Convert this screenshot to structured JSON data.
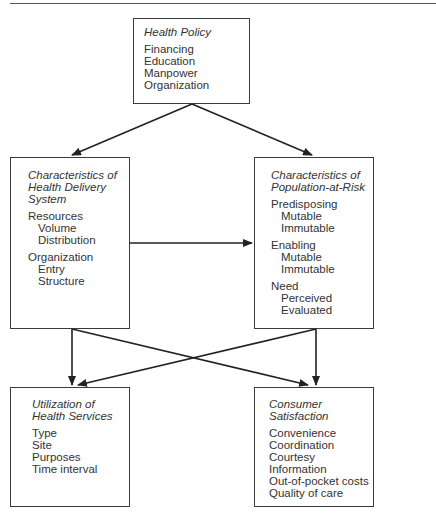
{
  "diagram": {
    "nodes": {
      "health_policy": {
        "title": "Health Policy",
        "items": [
          "Financing",
          "Education",
          "Manpower",
          "Organization"
        ]
      },
      "delivery_system": {
        "title_lines": [
          "Characteristics of",
          "Health Delivery",
          "System"
        ],
        "groups": [
          {
            "label": "Resources",
            "items": [
              "Volume",
              "Distribution"
            ]
          },
          {
            "label": "Organization",
            "items": [
              "Entry",
              "Structure"
            ]
          }
        ]
      },
      "population_at_risk": {
        "title_lines": [
          "Characteristics of",
          "Population-at-Risk"
        ],
        "groups": [
          {
            "label": "Predisposing",
            "items": [
              "Mutable",
              "Immutable"
            ]
          },
          {
            "label": "Enabling",
            "items": [
              "Mutable",
              "Immutable"
            ]
          },
          {
            "label": "Need",
            "items": [
              "Perceived",
              "Evaluated"
            ]
          }
        ]
      },
      "utilization": {
        "title_lines": [
          "Utilization of",
          "Health Services"
        ],
        "items": [
          "Type",
          "Site",
          "Purposes",
          "Time interval"
        ]
      },
      "consumer_satisfaction": {
        "title_lines": [
          "Consumer",
          "Satisfaction"
        ],
        "items": [
          "Convenience",
          "Coordination",
          "Courtesy",
          "Information",
          "Out-of-pocket costs",
          "Quality of care"
        ]
      }
    },
    "edges": [
      {
        "from": "Health Policy",
        "to": "Characteristics of Health Delivery System"
      },
      {
        "from": "Health Policy",
        "to": "Characteristics of Population-at-Risk"
      },
      {
        "from": "Characteristics of Health Delivery System",
        "to": "Characteristics of Population-at-Risk"
      },
      {
        "from": "Characteristics of Health Delivery System",
        "to": "Utilization of Health Services"
      },
      {
        "from": "Characteristics of Health Delivery System",
        "to": "Consumer Satisfaction"
      },
      {
        "from": "Characteristics of Population-at-Risk",
        "to": "Utilization of Health Services"
      },
      {
        "from": "Characteristics of Population-at-Risk",
        "to": "Consumer Satisfaction"
      }
    ]
  }
}
